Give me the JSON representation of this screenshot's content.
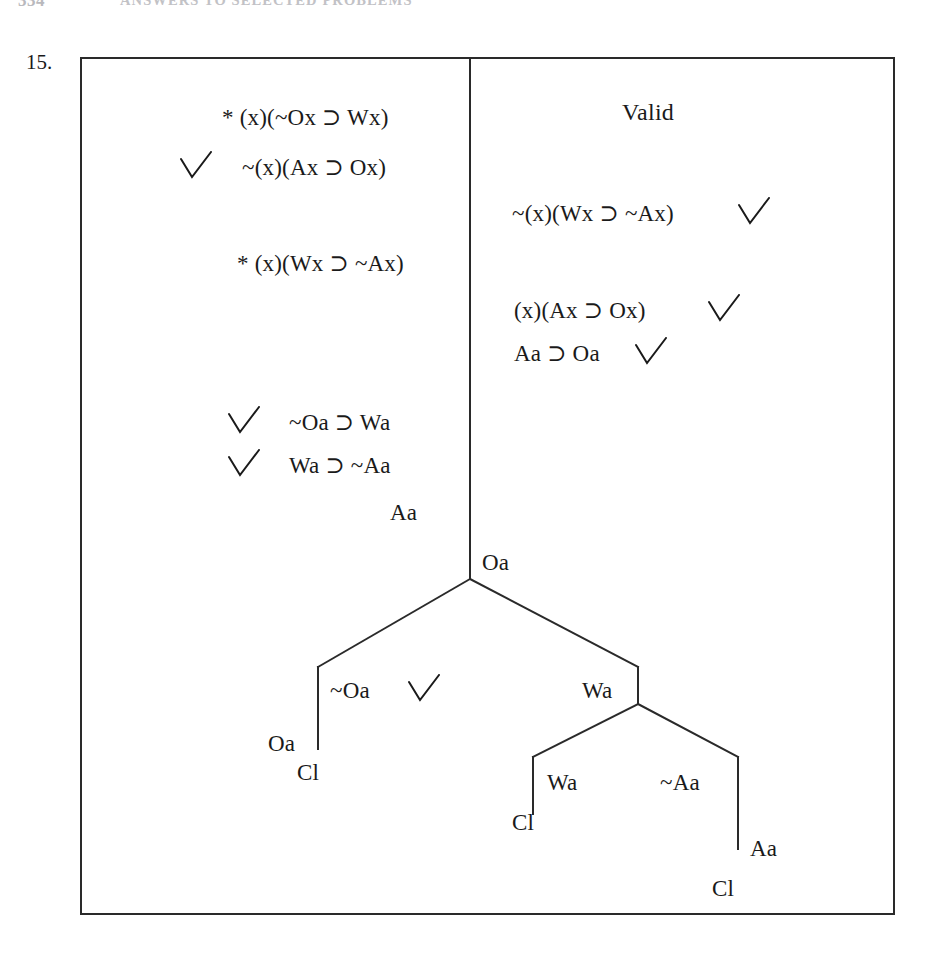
{
  "header": {
    "folio": "334",
    "running_head": "ANSWERS TO SELECTED PROBLEMS"
  },
  "problem": {
    "number": "15."
  },
  "verdict": {
    "label": "Valid"
  },
  "tree": {
    "type": "truth-tree",
    "status": "Valid",
    "left_stack": [
      {
        "id": "l1",
        "mark": "*",
        "formula": "(x)(~Ox ⊃ Wx)",
        "checked": false
      },
      {
        "id": "l2",
        "mark": "",
        "formula": "~(x)(Ax ⊃ Ox)",
        "checked": true
      },
      {
        "id": "l3",
        "mark": "*",
        "formula": "(x)(Wx ⊃ ~Ax)",
        "checked": false
      },
      {
        "id": "l4",
        "mark": "",
        "formula": "~Oa ⊃ Wa",
        "checked": true
      },
      {
        "id": "l5",
        "mark": "",
        "formula": "Wa ⊃ ~Aa",
        "checked": true
      },
      {
        "id": "l6",
        "mark": "",
        "formula": "Aa",
        "checked": false
      }
    ],
    "right_stack": [
      {
        "id": "r1",
        "formula": "~(x)(Wx ⊃ ~Ax)",
        "checked": true
      },
      {
        "id": "r2",
        "formula": "(x)(Ax ⊃ Ox)",
        "checked": true
      },
      {
        "id": "r3",
        "formula": "Aa ⊃ Oa",
        "checked": true
      }
    ],
    "trunk_tail": {
      "id": "t1",
      "formula": "Oa"
    },
    "branches": {
      "left": {
        "nodes": [
          {
            "id": "b1",
            "formula": "~Oa",
            "checked": true
          },
          {
            "id": "b2",
            "formula": "Oa",
            "checked": false
          }
        ],
        "closure": "Cl"
      },
      "right": {
        "nodes": [
          {
            "id": "b3",
            "formula": "Wa",
            "checked": false
          }
        ],
        "sub_left": {
          "nodes": [
            {
              "id": "b4",
              "formula": "Wa",
              "checked": false
            }
          ],
          "closure": "Cl"
        },
        "sub_right": {
          "nodes": [
            {
              "id": "b5",
              "formula": "~Aa",
              "checked": false
            },
            {
              "id": "b6",
              "formula": "Aa",
              "checked": false
            }
          ],
          "closure": "Cl"
        }
      }
    }
  },
  "colors": {
    "ink": "#1a1a1a",
    "rule": "#2a2a2a",
    "faded_header": "#c2c2c6",
    "paper": "#ffffff"
  }
}
